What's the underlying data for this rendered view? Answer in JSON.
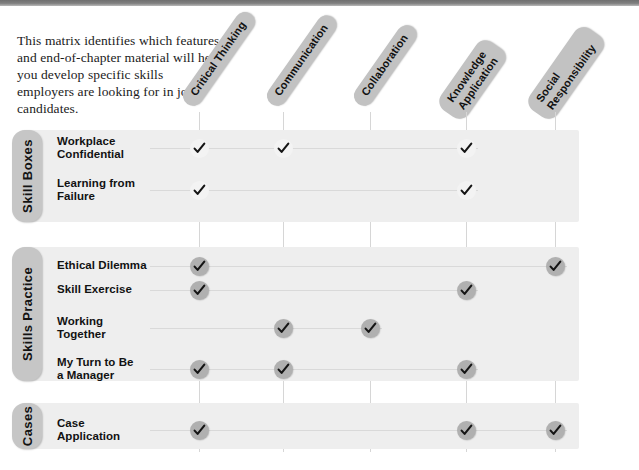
{
  "intro": {
    "text": "This matrix identifies which features and end-of-chapter material will help you develop specific skills employers are looking for in job candidates."
  },
  "columns": [
    {
      "id": "critical-thinking",
      "label": "Critical Thinking",
      "x": 199
    },
    {
      "id": "communication",
      "label": "Communication",
      "x": 283
    },
    {
      "id": "collaboration",
      "label": "Collaboration",
      "x": 370
    },
    {
      "id": "knowledge-application",
      "label": "Knowledge\nApplication",
      "x": 466
    },
    {
      "id": "social-responsibility",
      "label": "Social\nResponsibility",
      "x": 555
    }
  ],
  "sections": [
    {
      "id": "skill-boxes",
      "label": "Skill Boxes",
      "band_top": 130,
      "band_height": 92,
      "check_style": "light",
      "rows": [
        {
          "id": "workplace-confidential",
          "label": "Workplace\nConfidential",
          "y": 148,
          "checks": [
            "critical-thinking",
            "communication",
            "knowledge-application"
          ]
        },
        {
          "id": "learning-from-failure",
          "label": "Learning from\nFailure",
          "y": 190,
          "checks": [
            "critical-thinking",
            "knowledge-application"
          ]
        }
      ]
    },
    {
      "id": "skills-practice",
      "label": "Skills Practice",
      "band_top": 247,
      "band_height": 134,
      "check_style": "grey",
      "rows": [
        {
          "id": "ethical-dilemma",
          "label": "Ethical Dilemma",
          "y": 266,
          "checks": [
            "critical-thinking",
            "social-responsibility"
          ]
        },
        {
          "id": "skill-exercise",
          "label": "Skill Exercise",
          "y": 290,
          "checks": [
            "critical-thinking",
            "knowledge-application"
          ]
        },
        {
          "id": "working-together",
          "label": "Working\nTogether",
          "y": 328,
          "checks": [
            "communication",
            "collaboration"
          ]
        },
        {
          "id": "my-turn-to-be-a-manager",
          "label": "My Turn to Be\na Manager",
          "y": 369,
          "checks": [
            "critical-thinking",
            "communication",
            "knowledge-application"
          ]
        }
      ]
    },
    {
      "id": "cases",
      "label": "Cases",
      "band_top": 403,
      "band_height": 46,
      "check_style": "grey",
      "rows": [
        {
          "id": "case-application",
          "label": "Case\nApplication",
          "y": 430,
          "checks": [
            "critical-thinking",
            "knowledge-application",
            "social-responsibility"
          ]
        }
      ]
    }
  ],
  "colors": {
    "top_bar": "#7a7a7a",
    "pill": "#c2c2c2",
    "section_tab": "#c6c6c6",
    "section_band": "#eeeeee",
    "check_light": "#f3f3f3",
    "check_grey": "#b0b0b0",
    "rule": "#d9d9d9"
  },
  "icons": {
    "check": "check-icon"
  }
}
